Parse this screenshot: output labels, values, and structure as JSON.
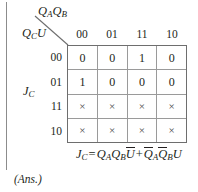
{
  "figure": {
    "type": "karnaugh-map",
    "top_axis_label": "QAQB",
    "top_axis_label_parts": {
      "v1": "Q",
      "s1": "A",
      "v2": "Q",
      "s2": "B"
    },
    "left_axis_label_parts": {
      "v1": "Q",
      "s1": "C",
      "v2": "U"
    },
    "output_label_parts": {
      "v1": "J",
      "s1": "C"
    },
    "column_headers": [
      "00",
      "01",
      "11",
      "10"
    ],
    "row_headers": [
      "00",
      "01",
      "11",
      "10"
    ],
    "cells": [
      [
        "0",
        "0",
        "1",
        "0"
      ],
      [
        "1",
        "0",
        "0",
        "0"
      ],
      [
        "×",
        "×",
        "×",
        "×"
      ],
      [
        "×",
        "×",
        "×",
        "×"
      ]
    ],
    "equation": {
      "lhs_var": "J",
      "lhs_sub": "C",
      "equals": "=",
      "term1": [
        {
          "v": "Q",
          "s": "A",
          "bar": false
        },
        {
          "v": "Q",
          "s": "B",
          "bar": false
        },
        {
          "v": "U",
          "s": "",
          "bar": true
        }
      ],
      "plus": "+",
      "term2": [
        {
          "v": "Q",
          "s": "A",
          "bar": true
        },
        {
          "v": "Q",
          "s": "B",
          "bar": true
        },
        {
          "v": "U",
          "s": "",
          "bar": false
        }
      ],
      "plain": "JC = QAQB U̅ + Q̅AQ̅BU"
    },
    "answer_tag": "(Ans.)",
    "colors": {
      "ink": "#231f20",
      "grid_outer": "#6e6e6e",
      "grid_inner": "#9a9a9a",
      "margin_rule": "#8c8c8c",
      "background": "#ffffff"
    }
  }
}
